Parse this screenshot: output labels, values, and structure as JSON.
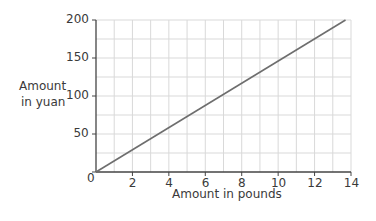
{
  "chart_data": {
    "type": "line",
    "title": "",
    "xlabel": "Amount in pounds",
    "ylabel": "Amount in yuan",
    "xlim": [
      0,
      14
    ],
    "ylim": [
      0,
      200
    ],
    "x_ticks": [
      0,
      2,
      4,
      6,
      8,
      10,
      12,
      14
    ],
    "y_ticks": [
      0,
      50,
      100,
      150,
      200
    ],
    "grid": true,
    "x_grid_step": 1,
    "y_grid_step": 25,
    "series": [
      {
        "name": "Conversion",
        "x": [
          0,
          13.7
        ],
        "y": [
          0,
          200
        ],
        "color": "#6e6e6e"
      }
    ]
  },
  "labels": {
    "ylabel_line1": "Amount",
    "ylabel_line2": "in yuan",
    "xlabel": "Amount in pounds",
    "origin": "0",
    "x_ticks": [
      "2",
      "4",
      "6",
      "8",
      "10",
      "12",
      "14"
    ],
    "y_ticks": [
      "50",
      "100",
      "150",
      "200"
    ]
  },
  "colors": {
    "grid": "#d9d9d9",
    "axis": "#444444",
    "line": "#6e6e6e"
  }
}
